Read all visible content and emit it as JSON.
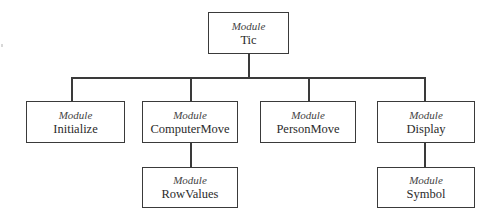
{
  "diagram": {
    "type": "module-hierarchy",
    "line_color": "#3a3a3a",
    "root": {
      "kind": "Module",
      "name": "Tic"
    },
    "children": [
      {
        "kind": "Module",
        "name": "Initialize"
      },
      {
        "kind": "Module",
        "name": "ComputerMove",
        "child": {
          "kind": "Module",
          "name": "RowValues"
        }
      },
      {
        "kind": "Module",
        "name": "PersonMove"
      },
      {
        "kind": "Module",
        "name": "Display",
        "child": {
          "kind": "Module",
          "name": "Symbol"
        }
      }
    ]
  }
}
